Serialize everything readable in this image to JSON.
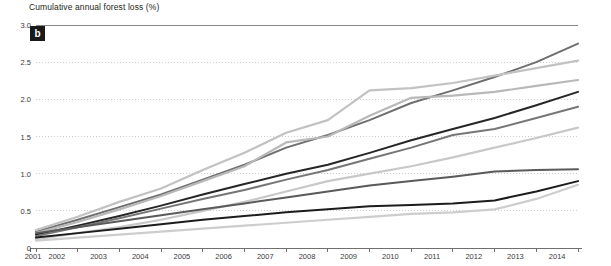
{
  "chart_data": {
    "type": "line",
    "title": "Cumulative annual forest loss (%)",
    "panel_label": "b",
    "xlabel": "",
    "ylabel": "Cumulative annual forest loss (%)",
    "x": [
      2001,
      2002,
      2003,
      2004,
      2005,
      2006,
      2007,
      2008,
      2009,
      2010,
      2011,
      2012,
      2013,
      2014
    ],
    "xtick_labels": [
      "2001",
      "2002",
      "2003",
      "2004",
      "2005",
      "2006",
      "2007",
      "2008",
      "2009",
      "2010",
      "2011",
      "2012",
      "2013",
      "2014"
    ],
    "ytick_labels": [
      "0",
      "0.5",
      "1.0",
      "1.5",
      "2.0",
      "2.5",
      "3.0"
    ],
    "yticks": [
      0,
      0.5,
      1.0,
      1.5,
      2.0,
      2.5,
      3.0
    ],
    "ylim": [
      0,
      3.0
    ],
    "xlim": [
      2001,
      2014
    ],
    "grid": "horizontal-dotted",
    "legend": "none",
    "series": [
      {
        "name": "series-1",
        "color": "#6f6f6f",
        "width": 2.0,
        "values": [
          0.22,
          0.38,
          0.55,
          0.72,
          0.92,
          1.12,
          1.35,
          1.52,
          1.72,
          1.95,
          2.12,
          2.3,
          2.5,
          2.75
        ]
      },
      {
        "name": "series-2",
        "color": "#c2c2c2",
        "width": 2.2,
        "values": [
          0.24,
          0.42,
          0.62,
          0.8,
          1.05,
          1.28,
          1.55,
          1.72,
          2.12,
          2.15,
          2.22,
          2.32,
          2.42,
          2.52
        ]
      },
      {
        "name": "series-3",
        "color": "#b8b8b8",
        "width": 2.2,
        "values": [
          0.2,
          0.35,
          0.52,
          0.7,
          0.9,
          1.1,
          1.42,
          1.5,
          1.78,
          2.02,
          2.05,
          2.1,
          2.18,
          2.26
        ]
      },
      {
        "name": "series-4",
        "color": "#262626",
        "width": 2.0,
        "values": [
          0.18,
          0.3,
          0.43,
          0.57,
          0.72,
          0.86,
          1.0,
          1.12,
          1.28,
          1.45,
          1.6,
          1.75,
          1.92,
          2.1
        ]
      },
      {
        "name": "series-5",
        "color": "#767676",
        "width": 2.0,
        "values": [
          0.16,
          0.28,
          0.4,
          0.53,
          0.66,
          0.78,
          0.92,
          1.05,
          1.2,
          1.35,
          1.52,
          1.6,
          1.75,
          1.9
        ]
      },
      {
        "name": "series-6",
        "color": "#c8c8c8",
        "width": 2.2,
        "values": [
          0.12,
          0.2,
          0.28,
          0.38,
          0.5,
          0.62,
          0.76,
          0.9,
          1.0,
          1.1,
          1.22,
          1.35,
          1.48,
          1.62
        ]
      },
      {
        "name": "series-7",
        "color": "#5a5a5a",
        "width": 2.0,
        "values": [
          0.2,
          0.28,
          0.36,
          0.44,
          0.52,
          0.6,
          0.68,
          0.76,
          0.84,
          0.9,
          0.96,
          1.03,
          1.05,
          1.06
        ]
      },
      {
        "name": "series-8",
        "color": "#1c1c1c",
        "width": 2.0,
        "values": [
          0.14,
          0.2,
          0.26,
          0.32,
          0.38,
          0.43,
          0.48,
          0.52,
          0.56,
          0.58,
          0.6,
          0.64,
          0.76,
          0.9
        ]
      },
      {
        "name": "series-9",
        "color": "#cdcdcd",
        "width": 2.2,
        "values": [
          0.1,
          0.14,
          0.18,
          0.22,
          0.26,
          0.3,
          0.34,
          0.38,
          0.42,
          0.46,
          0.48,
          0.52,
          0.66,
          0.85
        ]
      }
    ]
  },
  "axes": {
    "axis_color": "#6f6f6f",
    "gridline_color": "#c9c9c9",
    "tick_label_color": "#3a3a3a"
  }
}
